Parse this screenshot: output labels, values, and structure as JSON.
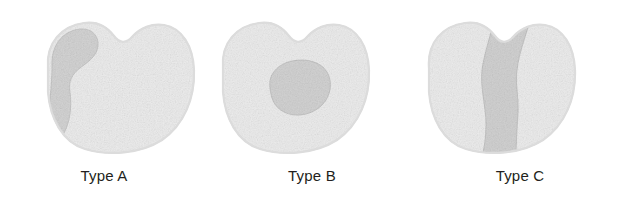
{
  "figure": {
    "background_color": "#ffffff",
    "panel_count": 3,
    "label_color": "#231f20",
    "body_fill_color": "#ececec",
    "body_edge_color": "#d0d0d0",
    "lesion_fill_color": "#d2d2d2",
    "lesion_edge_color": "#b8b8b8"
  },
  "panels": [
    {
      "id": "type-a",
      "label": "Type A",
      "region_name": "peripheral-crescent-region",
      "region_description": "comma shaped darker zone along the left margin"
    },
    {
      "id": "type-b",
      "label": "Type B",
      "region_name": "central-oval-region",
      "region_description": "rounded oval darker zone in the centre"
    },
    {
      "id": "type-c",
      "label": "Type C",
      "region_name": "vertical-band-region",
      "region_description": "S shaped darker band spanning top to bottom"
    }
  ]
}
